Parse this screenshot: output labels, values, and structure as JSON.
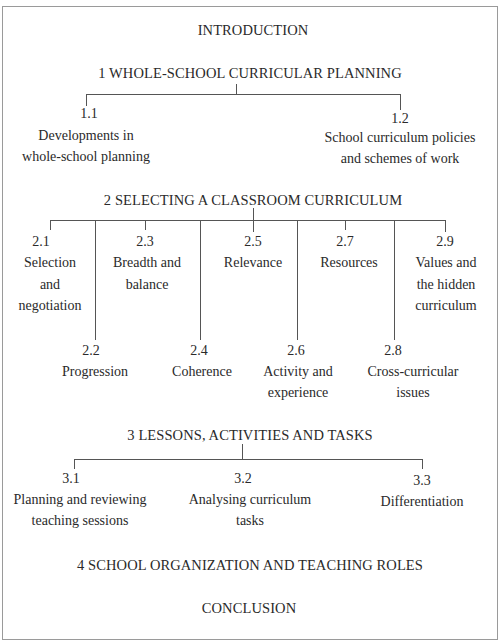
{
  "diagram": {
    "introduction": "INTRODUCTION",
    "sections": [
      {
        "title": "1 WHOLE-SCHOOL CURRICULAR PLANNING",
        "items": [
          {
            "num": "1.1",
            "lines": [
              "Developments in",
              "whole-school planning"
            ]
          },
          {
            "num": "1.2",
            "lines": [
              "School curriculum policies",
              "and schemes of work"
            ]
          }
        ]
      },
      {
        "title": "2 SELECTING A CLASSROOM CURRICULUM",
        "items": [
          {
            "num": "2.1",
            "lines": [
              "Selection",
              "and",
              "negotiation"
            ]
          },
          {
            "num": "2.2",
            "lines": [
              "Progression"
            ]
          },
          {
            "num": "2.3",
            "lines": [
              "Breadth and",
              "balance"
            ]
          },
          {
            "num": "2.4",
            "lines": [
              "Coherence"
            ]
          },
          {
            "num": "2.5",
            "lines": [
              "Relevance"
            ]
          },
          {
            "num": "2.6",
            "lines": [
              "Activity and",
              "experience"
            ]
          },
          {
            "num": "2.7",
            "lines": [
              "Resources"
            ]
          },
          {
            "num": "2.8",
            "lines": [
              "Cross-curricular",
              "issues"
            ]
          },
          {
            "num": "2.9",
            "lines": [
              "Values and",
              "the hidden",
              "curriculum"
            ]
          }
        ]
      },
      {
        "title": "3 LESSONS, ACTIVITIES AND TASKS",
        "items": [
          {
            "num": "3.1",
            "lines": [
              "Planning and reviewing",
              "teaching sessions"
            ]
          },
          {
            "num": "3.2",
            "lines": [
              "Analysing curriculum",
              "tasks"
            ]
          },
          {
            "num": "3.3",
            "lines": [
              "Differentiation"
            ]
          }
        ]
      },
      {
        "title": "4 SCHOOL ORGANIZATION AND TEACHING ROLES",
        "items": []
      }
    ],
    "conclusion": "CONCLUSION"
  }
}
